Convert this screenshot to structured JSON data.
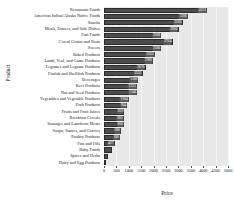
{
  "chart_data": {
    "type": "bar",
    "orientation": "horizontal",
    "title": "",
    "xlabel": "Price",
    "ylabel": "Product",
    "xlim": [
      0,
      5000
    ],
    "grid": true,
    "legend": "none",
    "xticks": [
      0,
      500,
      1000,
      1500,
      2000,
      2500,
      3000,
      3500,
      4000,
      4500,
      5000
    ],
    "categories": [
      "Restaurant Foods",
      "American Indian/Alaska Native Foods",
      "Snacks",
      "Meals, Entrees, and Side Dishes",
      "Fast Foods",
      "Cereal Grains and Pasta",
      "Sweets",
      "Baked Products",
      "Lamb, Veal, and Game Products",
      "Legumes and Legume Products",
      "Finfish and Shellfish Products",
      "Beverages",
      "Beef Products",
      "Nut and Seed Products",
      "Vegetables and Vegetable Products",
      "Pork Products",
      "Fruits and Fruit Juices",
      "Breakfast Cereals",
      "Sausages and Luncheon Meats",
      "Soups, Sauces, and Gravies",
      "Poultry Products",
      "Fats and Oils",
      "Baby Foods",
      "Spices and Herbs",
      "Dairy and Egg Products"
    ],
    "values": [
      4153,
      3386,
      3166,
      3006,
      2308,
      2764,
      2306,
      2052,
      1982,
      1676,
      1553,
      1388,
      1323,
      1346,
      1004,
      944,
      819,
      805,
      808,
      686,
      660,
      427,
      317,
      164,
      92
    ],
    "bar_labels": [
      "4153",
      "3386",
      "3166",
      "3006",
      "2308",
      "2764",
      "2306",
      "2052",
      "1982",
      "1676",
      "1553",
      "1388",
      "1323",
      "1346",
      "1004",
      "944",
      "819",
      "805",
      "808",
      "686",
      "660",
      "427",
      "317",
      "164",
      "92"
    ]
  }
}
